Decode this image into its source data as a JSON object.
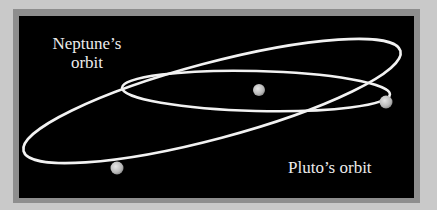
{
  "diagram": {
    "labels": {
      "neptune_orbit_line1": "Neptune’s",
      "neptune_orbit_line2": "orbit",
      "pluto_orbit": "Pluto’s orbit"
    },
    "colors": {
      "background": "#c9c9c9",
      "frame": "#8e8e8e",
      "panel": "#000000",
      "orbit_line": "#f2f2f2",
      "body": "#c8c8c8",
      "text": "#ececec"
    },
    "bodies": [
      {
        "name": "Sun",
        "x": 259,
        "y": 90,
        "r": 6
      },
      {
        "name": "Pluto",
        "x": 386,
        "y": 102,
        "r": 6
      },
      {
        "name": "Neptune",
        "x": 117,
        "y": 168,
        "r": 6
      }
    ]
  }
}
